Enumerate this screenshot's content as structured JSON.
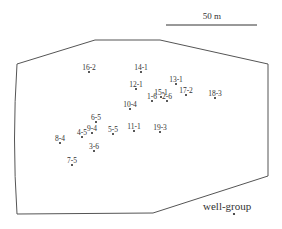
{
  "scale_bar": {
    "label": "50 m",
    "x1": 166,
    "x2": 257,
    "y": 25,
    "label_x": 212,
    "label_y": 19
  },
  "boundary": {
    "points": "17,64 95,40 160,40 268,64 268,176 153,213 17,214",
    "left_curve_control": "12,139",
    "stroke": "#555555"
  },
  "wells": [
    {
      "id": "16-2",
      "x": 89,
      "y": 72
    },
    {
      "id": "14-1",
      "x": 141,
      "y": 72
    },
    {
      "id": "12-1",
      "x": 136,
      "y": 89
    },
    {
      "id": "13-1",
      "x": 176,
      "y": 84
    },
    {
      "id": "17-2",
      "x": 186,
      "y": 95
    },
    {
      "id": "18-3",
      "x": 215,
      "y": 98
    },
    {
      "id": "15-1",
      "x": 161,
      "y": 97
    },
    {
      "id": "1-6",
      "x": 152,
      "y": 101
    },
    {
      "id": "2-6",
      "x": 167,
      "y": 101
    },
    {
      "id": "10-4",
      "x": 130,
      "y": 109
    },
    {
      "id": "6-5",
      "x": 96,
      "y": 122
    },
    {
      "id": "9-4",
      "x": 92,
      "y": 133
    },
    {
      "id": "4-5",
      "x": 82,
      "y": 137
    },
    {
      "id": "5-5",
      "x": 113,
      "y": 134
    },
    {
      "id": "11-1",
      "x": 134,
      "y": 131
    },
    {
      "id": "19-3",
      "x": 160,
      "y": 132
    },
    {
      "id": "8-4",
      "x": 60,
      "y": 143
    },
    {
      "id": "3-6",
      "x": 94,
      "y": 151
    },
    {
      "id": "7-5",
      "x": 72,
      "y": 165
    }
  ],
  "legend": {
    "label": "well-group",
    "text_x": 203,
    "text_y": 210,
    "dot_x": 234,
    "dot_y": 214
  }
}
